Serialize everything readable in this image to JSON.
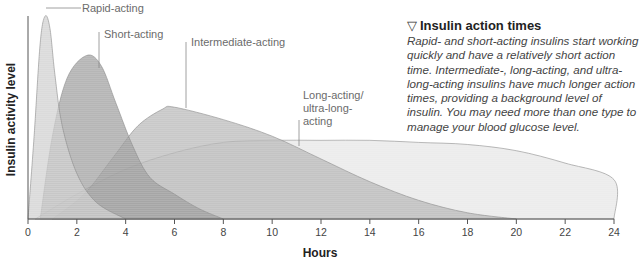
{
  "sidebar": {
    "icon": "triangle-down-icon",
    "icon_glyph": "▽",
    "title": "Insulin action times",
    "body": "Rapid- and short-acting insulins start working quickly and have a relatively short action time. Intermediate-, long-acting, and ultra-long-acting insulins have much longer action times, providing a background level of insulin. You may need more than one type to manage your blood glucose level."
  },
  "chart_data": {
    "type": "area",
    "title": "Insulin action times",
    "xlabel": "Hours",
    "ylabel": "Insulin activity level",
    "xlim": [
      0,
      24
    ],
    "ylim": [
      0,
      100
    ],
    "xticks": [
      0,
      2,
      4,
      6,
      8,
      10,
      12,
      14,
      16,
      18,
      20,
      22,
      24
    ],
    "grid": false,
    "legend": "inline labels",
    "series": [
      {
        "name": "Long-acting/ ultra-long-acting",
        "color": "#ececec",
        "onset": 0.3,
        "peak_hour": 10,
        "peak_level": 38,
        "end": 24,
        "points": [
          [
            0.3,
            0
          ],
          [
            2,
            12
          ],
          [
            4,
            24
          ],
          [
            6,
            32
          ],
          [
            8,
            37
          ],
          [
            10,
            38
          ],
          [
            12,
            38
          ],
          [
            14,
            38
          ],
          [
            16,
            37
          ],
          [
            18,
            36
          ],
          [
            20,
            33
          ],
          [
            22,
            27
          ],
          [
            24,
            19
          ],
          [
            24,
            0
          ]
        ]
      },
      {
        "name": "Intermediate-acting",
        "color": "#b4b4b4",
        "onset": 1,
        "peak_hour": 6,
        "peak_level": 54,
        "end": 20,
        "points": [
          [
            1,
            0
          ],
          [
            2.3,
            12
          ],
          [
            3.5,
            30
          ],
          [
            4.5,
            45
          ],
          [
            5.5,
            53
          ],
          [
            6,
            54
          ],
          [
            8,
            48
          ],
          [
            10,
            40
          ],
          [
            12,
            29
          ],
          [
            14,
            18
          ],
          [
            16,
            9
          ],
          [
            18,
            3
          ],
          [
            20,
            0
          ]
        ]
      },
      {
        "name": "Short-acting",
        "color": "#9a9a9a",
        "onset": 0.5,
        "peak_hour": 2.4,
        "peak_level": 79,
        "end": 8,
        "points": [
          [
            0.5,
            0
          ],
          [
            1,
            40
          ],
          [
            1.6,
            68
          ],
          [
            2.4,
            79
          ],
          [
            3,
            74
          ],
          [
            3.6,
            56
          ],
          [
            4.3,
            35
          ],
          [
            5,
            20
          ],
          [
            6,
            12
          ],
          [
            7,
            5
          ],
          [
            8,
            0
          ]
        ]
      },
      {
        "name": "Rapid-acting",
        "color": "#cdcdcd",
        "onset": 0,
        "peak_hour": 0.7,
        "peak_level": 98,
        "end": 4,
        "points": [
          [
            0,
            0
          ],
          [
            0.25,
            40
          ],
          [
            0.5,
            85
          ],
          [
            0.7,
            98
          ],
          [
            0.9,
            92
          ],
          [
            1.1,
            70
          ],
          [
            1.4,
            45
          ],
          [
            2,
            22
          ],
          [
            2.8,
            8
          ],
          [
            4,
            0
          ]
        ]
      }
    ],
    "annotations": [
      {
        "text": "Rapid-acting",
        "x": 1.1,
        "y": 97
      },
      {
        "text": "Short-acting",
        "x": 3.1,
        "y": 84
      },
      {
        "text": "Intermediate-acting",
        "x": 6.7,
        "y": 84
      },
      {
        "text": "Long-acting/ ultra-long-acting",
        "x": 11.1,
        "y": 59
      }
    ]
  }
}
